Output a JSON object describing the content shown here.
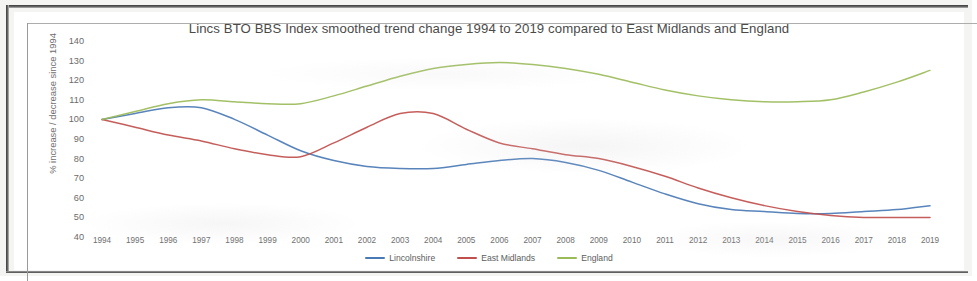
{
  "chart_data": {
    "type": "line",
    "title": "Lincs BTO BBS Index smoothed trend change 1994 to 2019 compared to East Midlands and England",
    "xlabel": "",
    "ylabel": "% increase / decrease since 1994",
    "ylim": [
      40,
      140
    ],
    "ytick_step": 10,
    "yticks": [
      140,
      130,
      120,
      110,
      100,
      90,
      80,
      70,
      60,
      50,
      40
    ],
    "grid": false,
    "legend_position": "bottom-center",
    "categories": [
      "1994",
      "1995",
      "1996",
      "1997",
      "1998",
      "1999",
      "2000",
      "2001",
      "2002",
      "2003",
      "2004",
      "2005",
      "2006",
      "2007",
      "2008",
      "2009",
      "2010",
      "2011",
      "2012",
      "2013",
      "2014",
      "2015",
      "2016",
      "2017",
      "2018",
      "2019"
    ],
    "series": [
      {
        "name": "Lincolnshire",
        "color": "#4a7ab5",
        "values": [
          100,
          103,
          106,
          106,
          100,
          92,
          84,
          79,
          76,
          75,
          75,
          77,
          79,
          80,
          78,
          74,
          68,
          62,
          57,
          54,
          53,
          52,
          52,
          53,
          54,
          56
        ]
      },
      {
        "name": "East Midlands",
        "color": "#c0504d",
        "values": [
          100,
          96,
          92,
          89,
          85,
          82,
          81,
          88,
          96,
          103,
          103,
          95,
          88,
          85,
          82,
          80,
          76,
          71,
          65,
          60,
          56,
          53,
          51,
          50,
          50,
          50
        ]
      },
      {
        "name": "England",
        "color": "#9bbb59",
        "values": [
          100,
          104,
          108,
          110,
          109,
          108,
          108,
          112,
          117,
          122,
          126,
          128,
          129,
          128,
          126,
          123,
          119,
          115,
          112,
          110,
          109,
          109,
          110,
          114,
          119,
          125
        ]
      }
    ]
  }
}
